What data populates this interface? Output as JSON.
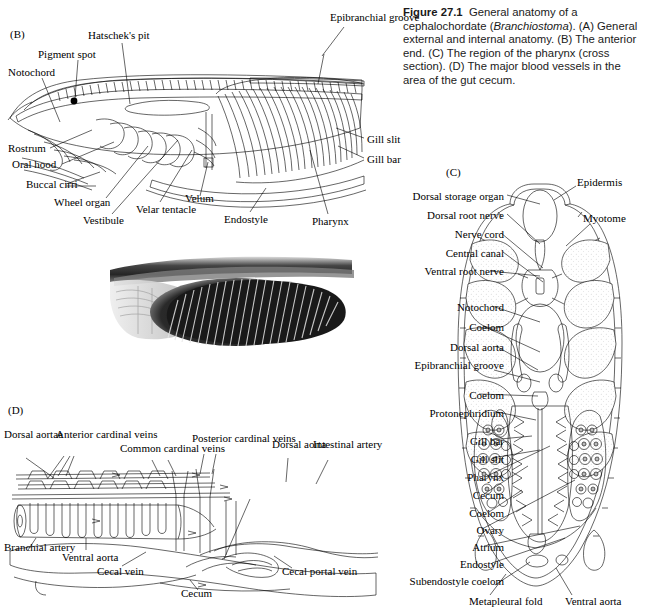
{
  "figure": {
    "number": "Figure 27.1",
    "title_main": "General anatomy of a cephalochordate (",
    "genus": "Branchiostoma",
    "title_tail": ").",
    "parts": "(A) General external and internal anatomy. (B) The anterior end. (C) The region of the pharynx (cross section). (D) The major blood vessels in the area of the gut cecum.",
    "caption_full": "Figure 27.1   General anatomy of a cephalochordate (Branchiostoma). (A) General external and internal anatomy. (B) The anterior end. (C) The region of the pharynx (cross section). (D) The major blood vessels in the area of the gut cecum."
  },
  "panels": {
    "b": {
      "letter": "(B)",
      "labels": [
        "Hatschek's pit",
        "Pigment spot",
        "Notochord",
        "Epibranchial groove",
        "Gill slit",
        "Gill bar",
        "Rostrum",
        "Oral hood",
        "Buccal cirri",
        "Wheel organ",
        "Vestibule",
        "Velar tentacle",
        "Velum",
        "Endostyle",
        "Pharynx"
      ]
    },
    "c": {
      "letter": "(C)",
      "labels_left": [
        "Dorsal storage organ",
        "Dorsal root nerve",
        "Nerve cord",
        "Central canal",
        "Ventral root nerve",
        "Notochord",
        "Coelom",
        "Dorsal aorta",
        "Epibranchial groove",
        "Coelom",
        "Protonephridium",
        "Gill bar",
        "Gill slit",
        "Pharynx",
        "Cecum",
        "Coelom",
        "Ovary",
        "Atrium",
        "Endostyle",
        "Subendostyle coelom"
      ],
      "labels_right": [
        "Epidermis",
        "Myotome"
      ],
      "labels_bottom": [
        "Metapleural fold",
        "Ventral aorta"
      ]
    },
    "d": {
      "letter": "(D)",
      "labels": [
        "Dorsal aortae",
        "Anterior cardinal veins",
        "Common cardinal veins",
        "Posterior cardinal veins",
        "Dorsal aorta",
        "Intestinal artery",
        "Branchial artery",
        "Ventral aorta",
        "Cecal vein",
        "Cecum",
        "Cecal portal vein"
      ]
    }
  },
  "colors": {
    "ink": "#000000",
    "stipple": "#8a8a8a",
    "dark_tissue": "#4a4a4a",
    "caption_text": "#1a1a1a",
    "photo_dark": "#111111",
    "photo_light": "#f2f2f2"
  }
}
